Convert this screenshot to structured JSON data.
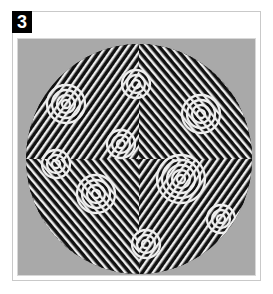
{
  "figure": {
    "label": "3",
    "colors": {
      "background": "#ffffff",
      "panel": "#a9a9a9",
      "badge": "#000000",
      "pattern_dark": "#111111",
      "pattern_light": "#f0f0f0"
    }
  }
}
